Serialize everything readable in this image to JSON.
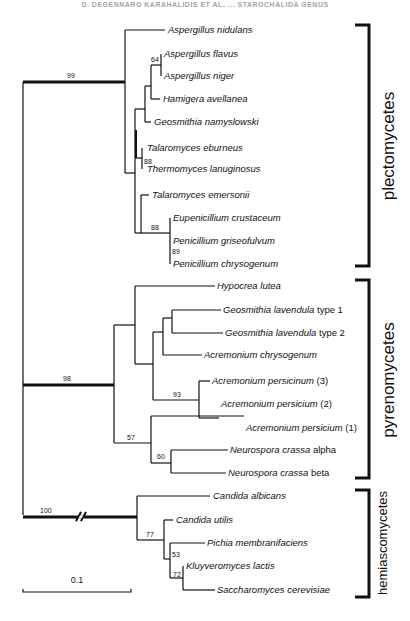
{
  "header": {
    "text": "D. DEGENNARO KARAHALIDIS ET AL. ... STAROCHALIDA GENUS"
  },
  "tree": {
    "root_bootstraps": {
      "plectomycetes": "99",
      "pyrenomycetes": "98",
      "hemiascomycetes": "100"
    },
    "leaves": [
      {
        "genus": "Aspergillus nidulans",
        "suffix": ""
      },
      {
        "genus": "Aspergillus flavus",
        "suffix": ""
      },
      {
        "genus": "Aspergillus niger",
        "suffix": ""
      },
      {
        "genus": "Hamigera avellanea",
        "suffix": ""
      },
      {
        "genus": "Geosmithia namyslowski",
        "suffix": ""
      },
      {
        "genus": "Talaromyces eburneus",
        "suffix": ""
      },
      {
        "genus": "Thermomyces lanuginosus",
        "suffix": ""
      },
      {
        "genus": "Talaromyces emersonii",
        "suffix": ""
      },
      {
        "genus": "Eupenicillium crustaceum",
        "suffix": ""
      },
      {
        "genus": "Penicillium griseofulvum",
        "suffix": ""
      },
      {
        "genus": "Penicillium chrysogenum",
        "suffix": ""
      },
      {
        "genus": "Hypocrea lutea",
        "suffix": ""
      },
      {
        "genus": "Geosmithia lavendula",
        "suffix": " type 1"
      },
      {
        "genus": "Geosmithia lavendula",
        "suffix": " type 2"
      },
      {
        "genus": "Acremonium chrysogenum",
        "suffix": ""
      },
      {
        "genus": "Acremonium persicinum",
        "suffix": " (3)"
      },
      {
        "genus": "Acremonium persicium",
        "suffix": " (2)"
      },
      {
        "genus": "Acremonium persicium",
        "suffix": " (1)"
      },
      {
        "genus": "Neurospora crassa",
        "suffix": " alpha"
      },
      {
        "genus": "Neurospora crassa",
        "suffix": " beta"
      },
      {
        "genus": "Candida albicans",
        "suffix": ""
      },
      {
        "genus": "Candida utilis",
        "suffix": ""
      },
      {
        "genus": "Pichia membranifaciens",
        "suffix": ""
      },
      {
        "genus": "Kluyveromyces lactis",
        "suffix": ""
      },
      {
        "genus": "Saccharomyces cerevisiae",
        "suffix": ""
      }
    ],
    "bootstraps": {
      "aspergillus_pair": "64",
      "talaromyces_thermomyces": "88",
      "penicillium_group": "88",
      "penicillium_pair": "89",
      "acremonium_persicinum_pair": "93",
      "acr_neurospora": "57",
      "neurospora_pair": "60",
      "candida_utilis_group": "77",
      "pichia_group": "53",
      "kluyveromyces_sacch": "72"
    },
    "groups": [
      "plectomycetes",
      "pyrenomycetes",
      "hemiascomycetes"
    ],
    "scale_bar": {
      "label": "0.1"
    }
  }
}
